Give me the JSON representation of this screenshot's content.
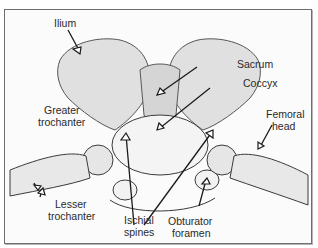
{
  "figure": {
    "colors": {
      "line": "#333333",
      "bone_shade": "#d9d9d9",
      "frame": "#6e6e6e",
      "background": "#fbfbfb"
    }
  },
  "labels": [
    {
      "id": "ilium",
      "text": "Ilium"
    },
    {
      "id": "sacrum",
      "text": "Sacrum"
    },
    {
      "id": "coccyx",
      "text": "Coccyx"
    },
    {
      "id": "greater_trochanter_1",
      "text": "Greater"
    },
    {
      "id": "greater_trochanter_2",
      "text": "trochanter"
    },
    {
      "id": "femoral_head_1",
      "text": "Femoral"
    },
    {
      "id": "femoral_head_2",
      "text": "head"
    },
    {
      "id": "lesser_trochanter_1",
      "text": "Lesser"
    },
    {
      "id": "lesser_trochanter_2",
      "text": "trochanter"
    },
    {
      "id": "ischial_spines_1",
      "text": "Ischial"
    },
    {
      "id": "ischial_spines_2",
      "text": "spines"
    },
    {
      "id": "obturator_foramen_1",
      "text": "Obturator"
    },
    {
      "id": "obturator_foramen_2",
      "text": "foramen"
    }
  ]
}
